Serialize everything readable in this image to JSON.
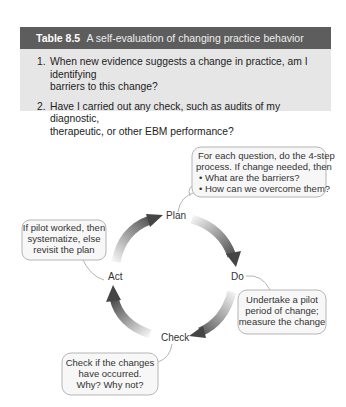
{
  "table": {
    "label": "Table 8.5",
    "title": "A self-evaluation of changing practice behavior",
    "items": [
      {
        "num": "1.",
        "line1": "When new evidence suggests a change in practice, am I identifying",
        "line2": "barriers to this change?"
      },
      {
        "num": "2.",
        "line1": "Have I carried out any check, such as audits of my diagnostic,",
        "line2": "therapeutic, or other EBM performance?"
      }
    ],
    "colors": {
      "header_bg": "#5d5d5d",
      "body_bg": "#e6e6e6"
    }
  },
  "cycle": {
    "nodes": {
      "plan": "Plan",
      "do": "Do",
      "check": "Check",
      "act": "Act"
    },
    "bubbles": {
      "plan": {
        "line1": "For each question, do the 4-step",
        "line2": "process. If change needed, then",
        "bullet1": "• What are the barriers?",
        "bullet2": "• How can we overcome them?"
      },
      "do": {
        "line1": "Undertake a pilot",
        "line2": "period of change;",
        "line3": "measure the change"
      },
      "check": {
        "line1": "Check if  the changes",
        "line2": "have occurred.",
        "line3": "Why? Why not?"
      },
      "act": {
        "line1": "If  pilot worked, then",
        "line2": "systematize, else",
        "line3": "revisit the plan"
      }
    },
    "colors": {
      "arrow_dark": "#4a4a4a",
      "arrow_light": "#f2f2f2",
      "bubble_fill": "#f7f7f7",
      "bubble_stroke": "#b5b5b5"
    }
  }
}
